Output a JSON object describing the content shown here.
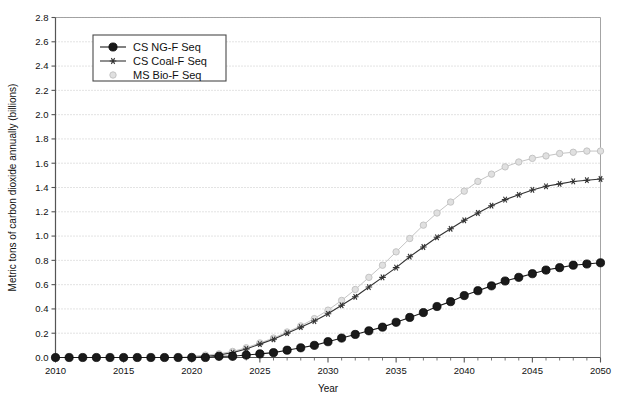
{
  "chart_data": {
    "type": "line",
    "title": "",
    "xlabel": "Year",
    "ylabel": "Metric tons of carbon dioxide annually (billions)",
    "xlim": [
      2010,
      2050
    ],
    "ylim": [
      0.0,
      2.8
    ],
    "ytick_step": 0.2,
    "xtick_step": 5,
    "grid": true,
    "legend_position": "upper-left-inside",
    "xticks": [
      "2010",
      "2015",
      "2020",
      "2025",
      "2030",
      "2035",
      "2040",
      "2045",
      "2050"
    ],
    "yticks": [
      "0.0",
      "0.2",
      "0.4",
      "0.6",
      "0.8",
      "1.0",
      "1.2",
      "1.4",
      "1.6",
      "1.8",
      "2.0",
      "2.2",
      "2.4",
      "2.6",
      "2.8"
    ],
    "x": [
      2010,
      2011,
      2012,
      2013,
      2014,
      2015,
      2016,
      2017,
      2018,
      2019,
      2020,
      2021,
      2022,
      2023,
      2024,
      2025,
      2026,
      2027,
      2028,
      2029,
      2030,
      2031,
      2032,
      2033,
      2034,
      2035,
      2036,
      2037,
      2038,
      2039,
      2040,
      2041,
      2042,
      2043,
      2044,
      2045,
      2046,
      2047,
      2048,
      2049,
      2050
    ],
    "series": [
      {
        "name": "CS NG-F Seq",
        "marker": "filled-circle",
        "color": "#1a1a1a",
        "values": [
          0.0,
          0.0,
          0.0,
          0.0,
          0.0,
          0.0,
          0.0,
          0.0,
          0.0,
          0.0,
          0.0,
          0.0,
          0.01,
          0.01,
          0.02,
          0.03,
          0.04,
          0.06,
          0.08,
          0.1,
          0.13,
          0.16,
          0.19,
          0.22,
          0.25,
          0.29,
          0.33,
          0.37,
          0.42,
          0.46,
          0.51,
          0.55,
          0.59,
          0.63,
          0.66,
          0.69,
          0.72,
          0.74,
          0.76,
          0.77,
          0.78
        ]
      },
      {
        "name": "CS Coal-F Seq",
        "marker": "star",
        "color": "#333333",
        "values": [
          0.0,
          0.0,
          0.0,
          0.0,
          0.0,
          0.0,
          0.0,
          0.0,
          0.0,
          0.0,
          0.0,
          0.01,
          0.02,
          0.04,
          0.07,
          0.11,
          0.15,
          0.2,
          0.25,
          0.3,
          0.36,
          0.43,
          0.5,
          0.58,
          0.66,
          0.74,
          0.83,
          0.91,
          0.99,
          1.06,
          1.13,
          1.19,
          1.25,
          1.3,
          1.34,
          1.38,
          1.41,
          1.43,
          1.45,
          1.46,
          1.47
        ]
      },
      {
        "name": "MS Bio-F Seq",
        "marker": "light-circle",
        "color": "#c4c4c4",
        "values": [
          0.0,
          0.0,
          0.0,
          0.0,
          0.0,
          0.0,
          0.0,
          0.0,
          0.0,
          0.0,
          0.01,
          0.02,
          0.03,
          0.05,
          0.08,
          0.12,
          0.16,
          0.21,
          0.26,
          0.32,
          0.39,
          0.47,
          0.56,
          0.66,
          0.76,
          0.87,
          0.98,
          1.09,
          1.19,
          1.28,
          1.37,
          1.45,
          1.51,
          1.57,
          1.61,
          1.64,
          1.66,
          1.68,
          1.69,
          1.7,
          1.7
        ]
      }
    ]
  }
}
